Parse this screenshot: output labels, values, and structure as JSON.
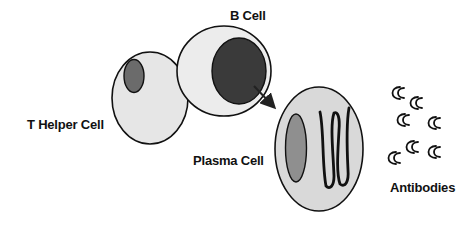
{
  "diagram": {
    "type": "biology-cell-diagram",
    "labels": {
      "b_cell": "B Cell",
      "t_helper_cell": "T Helper Cell",
      "plasma_cell": "Plasma Cell",
      "antibodies": "Antibodies"
    },
    "colors": {
      "cell_fill_light": "#e6e6e6",
      "b_cell_fill": "#ececec",
      "plasma_fill": "#d9d9d9",
      "t_nucleus": "#6b6b6b",
      "b_nucleus": "#3a3a3a",
      "plasma_nucleus": "#8f8f8f",
      "outline": "#111111"
    },
    "nodes": [
      {
        "id": "t_helper_cell",
        "label": "T Helper Cell"
      },
      {
        "id": "b_cell",
        "label": "B Cell"
      },
      {
        "id": "plasma_cell",
        "label": "Plasma Cell"
      },
      {
        "id": "antibodies",
        "label": "Antibodies",
        "count": 7
      }
    ],
    "edges": [
      {
        "from": "b_cell",
        "to": "plasma_cell",
        "style": "arrow"
      }
    ]
  }
}
